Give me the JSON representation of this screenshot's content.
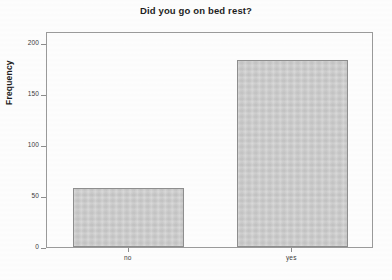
{
  "chart_data": {
    "type": "bar",
    "title": "Did you go on bed rest?",
    "xlabel": "",
    "ylabel": "Frequency",
    "categories": [
      "no",
      "yes"
    ],
    "values": [
      58,
      184
    ],
    "ylim": [
      0,
      212
    ],
    "yticks": [
      0,
      50,
      100,
      150,
      200
    ],
    "ytick_labels": [
      "0",
      "50",
      "100",
      "150",
      "200"
    ],
    "grid": false,
    "legend": false,
    "legend_position": "none",
    "bar_fill_color": "#cbcbcb",
    "bar_edge_color": "#8e8e8e",
    "axis_color": "#9a9a9a",
    "text_color": "#1e1e1e",
    "background_color": "#fdfdfd"
  }
}
